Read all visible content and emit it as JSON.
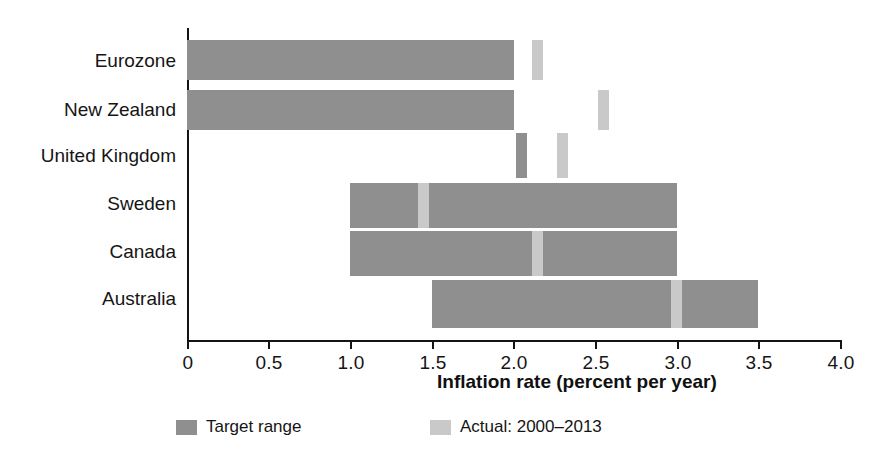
{
  "chart_data": {
    "type": "bar",
    "orientation": "horizontal",
    "title": "",
    "xlabel": "Inflation rate (percent per year)",
    "ylabel": "",
    "xlim": [
      0,
      4.0
    ],
    "xticks": [
      0,
      0.5,
      1.0,
      1.5,
      2.0,
      2.5,
      3.0,
      3.5,
      4.0
    ],
    "xtick_labels": [
      "0",
      "0.5",
      "1.0",
      "1.5",
      "2.0",
      "2.5",
      "3.0",
      "3.5",
      "4.0"
    ],
    "grid": false,
    "legend_position": "bottom-left",
    "categories": [
      "Eurozone",
      "New Zealand",
      "United Kingdom",
      "Sweden",
      "Canada",
      "Australia"
    ],
    "series": [
      {
        "name": "Target range",
        "type": "range",
        "color": "#8f8f8f",
        "values": [
          {
            "category": "Eurozone",
            "low": 0.0,
            "high": 2.0
          },
          {
            "category": "New Zealand",
            "low": 0.0,
            "high": 2.0
          },
          {
            "category": "United Kingdom",
            "low": 2.0,
            "high": 2.05
          },
          {
            "category": "Sweden",
            "low": 1.0,
            "high": 3.0
          },
          {
            "category": "Canada",
            "low": 1.0,
            "high": 3.0
          },
          {
            "category": "Australia",
            "low": 1.5,
            "high": 3.5
          }
        ]
      },
      {
        "name": "Actual: 2000–2013",
        "type": "marker",
        "color": "#c9c9c9",
        "values": [
          {
            "category": "Eurozone",
            "value": 2.15
          },
          {
            "category": "New Zealand",
            "value": 2.55
          },
          {
            "category": "United Kingdom",
            "value": 2.3
          },
          {
            "category": "Sweden",
            "value": 1.45
          },
          {
            "category": "Canada",
            "value": 2.15
          },
          {
            "category": "Australia",
            "value": 3.0
          }
        ]
      }
    ]
  },
  "legend": {
    "items": [
      {
        "label": "Target range",
        "color": "#8f8f8f"
      },
      {
        "label": "Actual: 2000–2013",
        "color": "#c9c9c9"
      }
    ]
  },
  "axis": {
    "x_title": "Inflation rate (percent per year)"
  },
  "colors": {
    "target": "#8f8f8f",
    "actual": "#c9c9c9",
    "axis": "#141414",
    "text": "#151515",
    "background": "#ffffff"
  }
}
